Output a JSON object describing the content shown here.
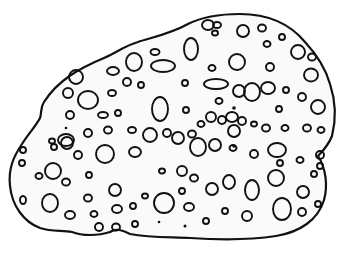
{
  "figure": {
    "colors": {
      "ink": "#111111",
      "paper": "#ffffff",
      "fill": "#fafafa"
    },
    "outline_path": "M 44 102 C 58 80, 80 68, 104 58 C 118 52, 124 46, 138 42 C 150 38, 170 34, 188 24 C 200 18, 215 14, 240 14 C 268 14, 290 24, 305 42 C 318 56, 326 70, 330 84 C 336 102, 336 120, 332 136 C 328 146, 322 152, 318 156 C 326 168, 328 186, 324 200 C 318 220, 300 232, 276 236 C 250 240, 220 240, 190 238 C 170 237, 150 238, 130 234 C 122 230, 116 228, 110 232 C 98 236, 82 236, 72 232 C 62 230, 52 232, 40 228 C 24 222, 12 206, 10 186 C 8 168, 14 156, 22 144 C 28 134, 36 126, 40 118 C 42 112, 40 108, 44 102 Z",
    "holes": [
      {
        "cx": 208,
        "cy": 25,
        "rx": 6,
        "ry": 5
      },
      {
        "cx": 217,
        "cy": 25,
        "rx": 4,
        "ry": 3
      },
      {
        "cx": 215,
        "cy": 33,
        "rx": 3,
        "ry": 2.5
      },
      {
        "cx": 243,
        "cy": 31,
        "rx": 6,
        "ry": 6
      },
      {
        "cx": 262,
        "cy": 28,
        "rx": 4,
        "ry": 3.5
      },
      {
        "cx": 282,
        "cy": 37,
        "rx": 3,
        "ry": 3
      },
      {
        "cx": 267,
        "cy": 44,
        "rx": 3.5,
        "ry": 3
      },
      {
        "cx": 298,
        "cy": 52,
        "rx": 7,
        "ry": 7
      },
      {
        "cx": 312,
        "cy": 57,
        "rx": 4,
        "ry": 3.5
      },
      {
        "cx": 311,
        "cy": 75,
        "rx": 7,
        "ry": 6.5
      },
      {
        "cx": 191,
        "cy": 49,
        "rx": 7,
        "ry": 11
      },
      {
        "cx": 155,
        "cy": 52,
        "rx": 4.5,
        "ry": 3
      },
      {
        "cx": 134,
        "cy": 62,
        "rx": 8,
        "ry": 9
      },
      {
        "cx": 163,
        "cy": 66,
        "rx": 12,
        "ry": 6
      },
      {
        "cx": 113,
        "cy": 71,
        "rx": 6,
        "ry": 4
      },
      {
        "cx": 76,
        "cy": 77,
        "rx": 7,
        "ry": 7
      },
      {
        "cx": 237,
        "cy": 62,
        "rx": 8,
        "ry": 8
      },
      {
        "cx": 212,
        "cy": 68,
        "rx": 3.5,
        "ry": 3
      },
      {
        "cx": 270,
        "cy": 67,
        "rx": 4,
        "ry": 4
      },
      {
        "cx": 127,
        "cy": 82,
        "rx": 4,
        "ry": 4
      },
      {
        "cx": 141,
        "cy": 85,
        "rx": 3,
        "ry": 3
      },
      {
        "cx": 185,
        "cy": 83,
        "rx": 3,
        "ry": 3
      },
      {
        "cx": 216,
        "cy": 84,
        "rx": 12,
        "ry": 5
      },
      {
        "cx": 239,
        "cy": 91,
        "rx": 6,
        "ry": 6
      },
      {
        "cx": 252,
        "cy": 92,
        "rx": 8,
        "ry": 9
      },
      {
        "cx": 268,
        "cy": 88,
        "rx": 7,
        "ry": 6
      },
      {
        "cx": 68,
        "cy": 93,
        "rx": 5,
        "ry": 5
      },
      {
        "cx": 88,
        "cy": 100,
        "rx": 10,
        "ry": 9
      },
      {
        "cx": 112,
        "cy": 93,
        "rx": 4,
        "ry": 3
      },
      {
        "cx": 286,
        "cy": 90,
        "rx": 3,
        "ry": 3
      },
      {
        "cx": 302,
        "cy": 97,
        "rx": 4,
        "ry": 4
      },
      {
        "cx": 219,
        "cy": 101,
        "rx": 3.5,
        "ry": 3
      },
      {
        "cx": 160,
        "cy": 109,
        "rx": 8,
        "ry": 12
      },
      {
        "cx": 186,
        "cy": 110,
        "rx": 3,
        "ry": 3
      },
      {
        "cx": 279,
        "cy": 109,
        "rx": 3,
        "ry": 3
      },
      {
        "cx": 318,
        "cy": 107,
        "rx": 7,
        "ry": 7
      },
      {
        "cx": 70,
        "cy": 115,
        "rx": 4,
        "ry": 4
      },
      {
        "cx": 103,
        "cy": 115,
        "rx": 5,
        "ry": 3
      },
      {
        "cx": 118,
        "cy": 113,
        "rx": 3,
        "ry": 3
      },
      {
        "cx": 211,
        "cy": 117,
        "rx": 5,
        "ry": 5
      },
      {
        "cx": 222,
        "cy": 120,
        "rx": 4,
        "ry": 4
      },
      {
        "cx": 232,
        "cy": 117,
        "rx": 6,
        "ry": 5
      },
      {
        "cx": 234,
        "cy": 131,
        "rx": 6,
        "ry": 6
      },
      {
        "cx": 242,
        "cy": 121,
        "rx": 4,
        "ry": 4
      },
      {
        "cx": 201,
        "cy": 124,
        "rx": 3.5,
        "ry": 3
      },
      {
        "cx": 254,
        "cy": 124,
        "rx": 3,
        "ry": 2.5
      },
      {
        "cx": 266,
        "cy": 128,
        "rx": 4,
        "ry": 3.5
      },
      {
        "cx": 285,
        "cy": 128,
        "rx": 3.5,
        "ry": 3
      },
      {
        "cx": 307,
        "cy": 128,
        "rx": 4,
        "ry": 3.5
      },
      {
        "cx": 321,
        "cy": 130,
        "rx": 3.5,
        "ry": 3
      },
      {
        "cx": 66,
        "cy": 140,
        "rx": 8,
        "ry": 6
      },
      {
        "cx": 88,
        "cy": 133,
        "rx": 4,
        "ry": 4
      },
      {
        "cx": 108,
        "cy": 130,
        "rx": 4,
        "ry": 3.5
      },
      {
        "cx": 132,
        "cy": 130,
        "rx": 4,
        "ry": 3
      },
      {
        "cx": 178,
        "cy": 138,
        "rx": 6,
        "ry": 6
      },
      {
        "cx": 192,
        "cy": 134,
        "rx": 4,
        "ry": 3.5
      },
      {
        "cx": 150,
        "cy": 135,
        "rx": 7,
        "ry": 7
      },
      {
        "cx": 167,
        "cy": 133,
        "rx": 4,
        "ry": 4
      },
      {
        "cx": 52,
        "cy": 141,
        "rx": 3,
        "ry": 2.5
      },
      {
        "cx": 23,
        "cy": 150,
        "rx": 3,
        "ry": 3
      },
      {
        "cx": 54,
        "cy": 147,
        "rx": 3,
        "ry": 3
      },
      {
        "cx": 67,
        "cy": 143,
        "rx": 6,
        "ry": 6
      },
      {
        "cx": 78,
        "cy": 155,
        "rx": 4,
        "ry": 4
      },
      {
        "cx": 105,
        "cy": 154,
        "rx": 9,
        "ry": 9
      },
      {
        "cx": 135,
        "cy": 152,
        "rx": 6,
        "ry": 5
      },
      {
        "cx": 198,
        "cy": 147,
        "rx": 8,
        "ry": 9
      },
      {
        "cx": 215,
        "cy": 145,
        "rx": 6,
        "ry": 6
      },
      {
        "cx": 233,
        "cy": 148,
        "rx": 3.5,
        "ry": 3
      },
      {
        "cx": 254,
        "cy": 154,
        "rx": 4,
        "ry": 4
      },
      {
        "cx": 277,
        "cy": 150,
        "rx": 9,
        "ry": 7
      },
      {
        "cx": 320,
        "cy": 155,
        "rx": 4,
        "ry": 4
      },
      {
        "cx": 320,
        "cy": 166,
        "rx": 3,
        "ry": 3
      },
      {
        "cx": 22,
        "cy": 163,
        "rx": 3,
        "ry": 3
      },
      {
        "cx": 53,
        "cy": 171,
        "rx": 8,
        "ry": 8
      },
      {
        "cx": 66,
        "cy": 182,
        "rx": 4,
        "ry": 3.5
      },
      {
        "cx": 89,
        "cy": 175,
        "rx": 3,
        "ry": 3
      },
      {
        "cx": 280,
        "cy": 163,
        "rx": 3,
        "ry": 3
      },
      {
        "cx": 300,
        "cy": 160,
        "rx": 3.5,
        "ry": 3
      },
      {
        "cx": 39,
        "cy": 176,
        "rx": 3.5,
        "ry": 3
      },
      {
        "cx": 162,
        "cy": 171,
        "rx": 3,
        "ry": 2.5
      },
      {
        "cx": 182,
        "cy": 171,
        "rx": 5,
        "ry": 5
      },
      {
        "cx": 194,
        "cy": 178,
        "rx": 4,
        "ry": 3.5
      },
      {
        "cx": 212,
        "cy": 189,
        "rx": 6,
        "ry": 6
      },
      {
        "cx": 229,
        "cy": 182,
        "rx": 6,
        "ry": 7
      },
      {
        "cx": 252,
        "cy": 190,
        "rx": 7,
        "ry": 10
      },
      {
        "cx": 276,
        "cy": 178,
        "rx": 8,
        "ry": 8
      },
      {
        "cx": 314,
        "cy": 174,
        "rx": 3,
        "ry": 3
      },
      {
        "cx": 303,
        "cy": 192,
        "rx": 6,
        "ry": 6
      },
      {
        "cx": 115,
        "cy": 190,
        "rx": 6,
        "ry": 6
      },
      {
        "cx": 88,
        "cy": 198,
        "rx": 4,
        "ry": 3.5
      },
      {
        "cx": 23,
        "cy": 200,
        "rx": 3,
        "ry": 4
      },
      {
        "cx": 50,
        "cy": 203,
        "rx": 8,
        "ry": 9
      },
      {
        "cx": 70,
        "cy": 215,
        "rx": 5,
        "ry": 4
      },
      {
        "cx": 94,
        "cy": 214,
        "rx": 3.5,
        "ry": 3
      },
      {
        "cx": 117,
        "cy": 209,
        "rx": 5,
        "ry": 4
      },
      {
        "cx": 133,
        "cy": 206,
        "rx": 3,
        "ry": 3
      },
      {
        "cx": 145,
        "cy": 196,
        "rx": 3,
        "ry": 2.5
      },
      {
        "cx": 164,
        "cy": 203,
        "rx": 10,
        "ry": 10
      },
      {
        "cx": 182,
        "cy": 191,
        "rx": 3,
        "ry": 3
      },
      {
        "cx": 189,
        "cy": 207,
        "rx": 5,
        "ry": 4
      },
      {
        "cx": 225,
        "cy": 211,
        "rx": 3,
        "ry": 3
      },
      {
        "cx": 247,
        "cy": 216,
        "rx": 5,
        "ry": 5
      },
      {
        "cx": 282,
        "cy": 209,
        "rx": 9,
        "ry": 11
      },
      {
        "cx": 302,
        "cy": 212,
        "rx": 4,
        "ry": 4
      },
      {
        "cx": 318,
        "cy": 204,
        "rx": 3,
        "ry": 3
      },
      {
        "cx": 99,
        "cy": 227,
        "rx": 4,
        "ry": 4
      },
      {
        "cx": 116,
        "cy": 227,
        "rx": 4,
        "ry": 3.5
      },
      {
        "cx": 135,
        "cy": 224,
        "rx": 3,
        "ry": 3
      },
      {
        "cx": 206,
        "cy": 221,
        "rx": 3,
        "ry": 3
      }
    ],
    "dots": [
      {
        "cx": 234,
        "cy": 108,
        "r": 1.8
      },
      {
        "cx": 234,
        "cy": 146,
        "r": 1.8
      },
      {
        "cx": 159,
        "cy": 222,
        "r": 1.3
      },
      {
        "cx": 185,
        "cy": 226,
        "r": 1.5
      },
      {
        "cx": 66,
        "cy": 128,
        "r": 1.3
      }
    ]
  }
}
